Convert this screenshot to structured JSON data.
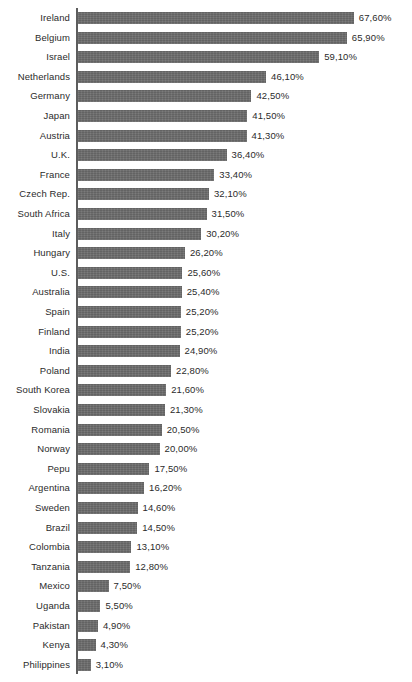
{
  "chart_data": {
    "type": "bar",
    "orientation": "horizontal",
    "title": "",
    "subtitle": "",
    "xlabel": "",
    "ylabel": "",
    "grid": false,
    "legend": false,
    "value_suffix": "%",
    "decimal_separator": ",",
    "xlim": [
      0,
      67.6
    ],
    "categories": [
      "Ireland",
      "Belgium",
      "Israel",
      "Netherlands",
      "Germany",
      "Japan",
      "Austria",
      "U.K.",
      "France",
      "Czech Rep.",
      "South Africa",
      "Italy",
      "Hungary",
      "U.S.",
      "Australia",
      "Spain",
      "Finland",
      "India",
      "Poland",
      "South Korea",
      "Slovakia",
      "Romania",
      "Norway",
      "Pepu",
      "Argentina",
      "Sweden",
      "Brazil",
      "Colombia",
      "Tanzania",
      "Mexico",
      "Uganda",
      "Pakistan",
      "Kenya",
      "Philippines"
    ],
    "values": [
      67.6,
      65.9,
      59.1,
      46.1,
      42.5,
      41.5,
      41.3,
      36.4,
      33.4,
      32.1,
      31.5,
      30.2,
      26.2,
      25.6,
      25.4,
      25.2,
      25.2,
      24.9,
      22.8,
      21.6,
      21.3,
      20.5,
      20.0,
      17.5,
      16.2,
      14.6,
      14.5,
      13.1,
      12.8,
      7.5,
      5.5,
      4.9,
      4.3,
      3.1
    ],
    "value_labels": [
      "67,60%",
      "65,90%",
      "59,10%",
      "46,10%",
      "42,50%",
      "41,50%",
      "41,30%",
      "36,40%",
      "33,40%",
      "32,10%",
      "31,50%",
      "30,20%",
      "26,20%",
      "25,60%",
      "25,40%",
      "25,20%",
      "25,20%",
      "24,90%",
      "22,80%",
      "21,60%",
      "21,30%",
      "20,50%",
      "20,00%",
      "17,50%",
      "16,20%",
      "14,60%",
      "14,50%",
      "13,10%",
      "12,80%",
      "7,50%",
      "5,50%",
      "4,90%",
      "4,30%",
      "3,10%"
    ]
  },
  "style": {
    "bar_color": "#6b6b6b",
    "axis_color": "#5d5d5d",
    "text_color": "#2b2b2b",
    "background_color": "#ffffff"
  }
}
